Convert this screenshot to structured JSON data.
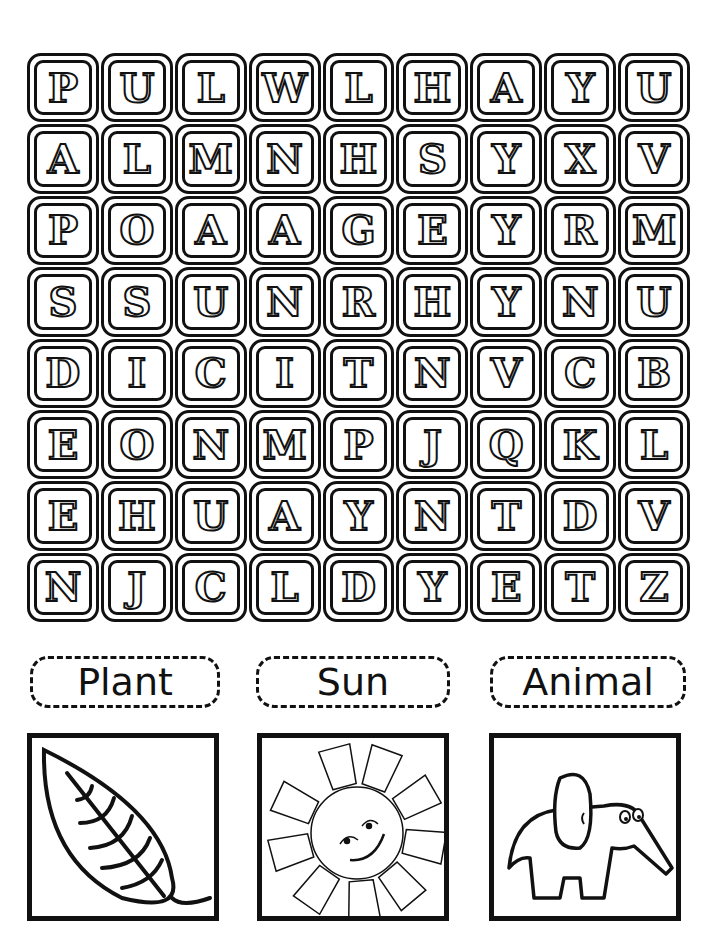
{
  "worksheet": {
    "grid": {
      "rows": 8,
      "cols": 9,
      "letters": [
        [
          "P",
          "U",
          "L",
          "W",
          "L",
          "H",
          "A",
          "Y",
          "U"
        ],
        [
          "A",
          "L",
          "M",
          "N",
          "H",
          "S",
          "Y",
          "X",
          "V"
        ],
        [
          "P",
          "O",
          "A",
          "A",
          "G",
          "E",
          "Y",
          "R",
          "M"
        ],
        [
          "S",
          "S",
          "U",
          "N",
          "R",
          "H",
          "Y",
          "N",
          "U"
        ],
        [
          "D",
          "I",
          "C",
          "I",
          "T",
          "N",
          "V",
          "C",
          "B"
        ],
        [
          "E",
          "O",
          "N",
          "M",
          "P",
          "J",
          "Q",
          "K",
          "L"
        ],
        [
          "E",
          "H",
          "U",
          "A",
          "Y",
          "N",
          "T",
          "D",
          "V"
        ],
        [
          "N",
          "J",
          "C",
          "L",
          "D",
          "Y",
          "E",
          "T",
          "Z"
        ]
      ]
    },
    "word_labels": [
      {
        "text": "Plant"
      },
      {
        "text": "Sun"
      },
      {
        "text": "Animal"
      }
    ],
    "pictures": [
      {
        "icon": "leaf-icon",
        "label": "Plant"
      },
      {
        "icon": "sun-icon",
        "label": "Sun"
      },
      {
        "icon": "elephant-icon",
        "label": "Animal"
      }
    ],
    "colors": {
      "ink": "#111111",
      "paper": "#ffffff"
    }
  }
}
